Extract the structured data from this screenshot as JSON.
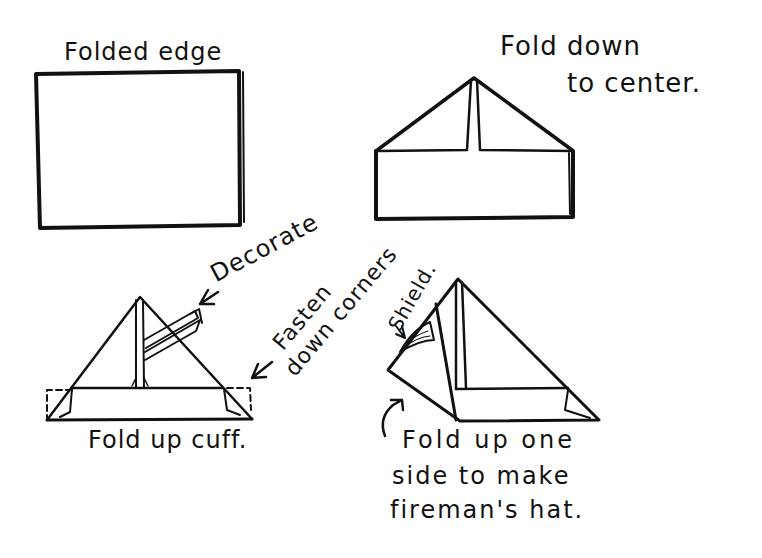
{
  "diagram": {
    "type": "instructional-sketch",
    "ink_color": "#111111",
    "background": "#ffffff"
  },
  "steps": [
    {
      "id": "step1",
      "label": "Folded edge"
    },
    {
      "id": "step2",
      "label_line1": "Fold down",
      "label_line2": "to center."
    },
    {
      "id": "step3",
      "label": "Fold up cuff.",
      "annotation_decorate": "Decorate",
      "annotation_fasten_line1": "Fasten",
      "annotation_fasten_line2": "down corners"
    },
    {
      "id": "step4",
      "annotation_shield": "Shield.",
      "label_line1": "Fold up one",
      "label_line2": "side to make",
      "label_line3": "fireman's hat."
    }
  ],
  "icons": {
    "arrow_left": "←"
  }
}
